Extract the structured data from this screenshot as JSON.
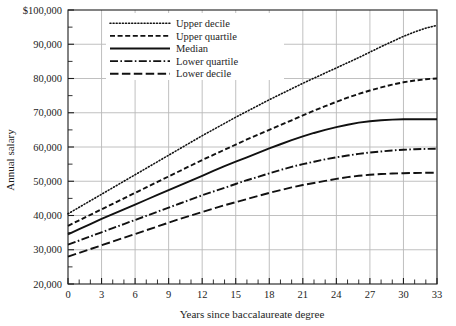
{
  "chart_data": {
    "type": "line",
    "title": "",
    "xlabel": "Years since baccalaureate degree",
    "ylabel": "Annual salary",
    "xlim": [
      0,
      33
    ],
    "ylim": [
      20000,
      100000
    ],
    "grid": true,
    "legend_position": "top-center",
    "x_major_step": 3,
    "x_minor_step": 1,
    "y_major_step": 10000,
    "y_minor_step": 5000,
    "xticklabels": [
      "0",
      "3",
      "6",
      "9",
      "12",
      "15",
      "18",
      "21",
      "24",
      "27",
      "30",
      "33"
    ],
    "xtickvalues": [
      0,
      3,
      6,
      9,
      12,
      15,
      18,
      21,
      24,
      27,
      30,
      33
    ],
    "yticklabels": [
      "20,000",
      "30,000",
      "40,000",
      "50,000",
      "60,000",
      "70,000",
      "80,000",
      "90,000",
      "$100,000"
    ],
    "ytickvalues": [
      20000,
      30000,
      40000,
      50000,
      60000,
      70000,
      80000,
      90000,
      100000
    ],
    "x": [
      0,
      1,
      2,
      3,
      4,
      5,
      6,
      7,
      8,
      9,
      10,
      11,
      12,
      13,
      14,
      15,
      16,
      17,
      18,
      19,
      20,
      21,
      22,
      23,
      24,
      25,
      26,
      27,
      28,
      29,
      30,
      31,
      32,
      33
    ],
    "series": [
      {
        "name": "Upper decile",
        "style": "dotted",
        "color": "#111111",
        "values": [
          40500,
          42400,
          44300,
          46200,
          48100,
          50000,
          51900,
          53800,
          55700,
          57600,
          59500,
          61400,
          63300,
          65100,
          66900,
          68700,
          70400,
          72100,
          73800,
          75400,
          77000,
          78600,
          80100,
          81600,
          83100,
          84600,
          86100,
          87700,
          89300,
          90800,
          92300,
          93600,
          94700,
          95500
        ]
      },
      {
        "name": "Upper quartile",
        "style": "dashed",
        "color": "#111111",
        "values": [
          37000,
          38600,
          40200,
          41800,
          43400,
          45000,
          46600,
          48200,
          49800,
          51400,
          53000,
          54600,
          56200,
          57700,
          59200,
          60700,
          62200,
          63600,
          65000,
          66400,
          67800,
          69200,
          70600,
          71900,
          73200,
          74400,
          75500,
          76500,
          77400,
          78200,
          78900,
          79400,
          79800,
          80000
        ]
      },
      {
        "name": "Median",
        "style": "solid",
        "color": "#111111",
        "values": [
          34500,
          36000,
          37500,
          39000,
          40400,
          41800,
          43200,
          44600,
          46000,
          47400,
          48800,
          50200,
          51600,
          53000,
          54400,
          55700,
          57000,
          58300,
          59600,
          60800,
          62000,
          63100,
          64100,
          65000,
          65800,
          66500,
          67100,
          67500,
          67800,
          68000,
          68100,
          68100,
          68100,
          68100
        ]
      },
      {
        "name": "Lower quartile",
        "style": "dashdot",
        "color": "#111111",
        "values": [
          31500,
          32700,
          33900,
          35100,
          36300,
          37500,
          38700,
          39900,
          41100,
          42300,
          43500,
          44700,
          45900,
          47000,
          48100,
          49200,
          50300,
          51300,
          52300,
          53300,
          54200,
          55000,
          55700,
          56400,
          57000,
          57500,
          58000,
          58400,
          58700,
          59000,
          59200,
          59350,
          59450,
          59500
        ]
      },
      {
        "name": "Lower decile",
        "style": "longdash",
        "color": "#111111",
        "values": [
          28000,
          29100,
          30200,
          31300,
          32400,
          33500,
          34600,
          35700,
          36800,
          37900,
          39000,
          40000,
          41000,
          42000,
          43000,
          43900,
          44800,
          45700,
          46600,
          47400,
          48200,
          48900,
          49500,
          50100,
          50700,
          51200,
          51600,
          51900,
          52100,
          52250,
          52350,
          52420,
          52470,
          52500
        ]
      }
    ],
    "legend_entries": [
      {
        "label": "Upper decile",
        "style": "dotted"
      },
      {
        "label": "Upper quartile",
        "style": "dashed"
      },
      {
        "label": "Median",
        "style": "solid"
      },
      {
        "label": "Lower quartile",
        "style": "dashdot"
      },
      {
        "label": "Lower decile",
        "style": "longdash"
      }
    ]
  },
  "colors": {
    "axis": "#1d1d1d",
    "gridline": "#b9b9b9",
    "line": "#111111",
    "background": "#ffffff"
  }
}
